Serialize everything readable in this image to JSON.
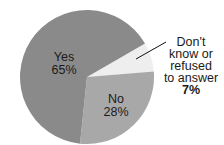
{
  "chart_data": {
    "type": "pie",
    "title": "",
    "slices": [
      {
        "label": "Yes",
        "value": 65,
        "display": "65%",
        "color": "#8a8a8a"
      },
      {
        "label": "No",
        "value": 28,
        "display": "28%",
        "color": "#a8a8a8"
      },
      {
        "label": "Don't know or refused to answer",
        "value": 7,
        "display": "7%",
        "color": "#eeeeee"
      }
    ],
    "start_angle_deg": 60,
    "direction": "clockwise",
    "legend": "none (labels on/near slices)"
  },
  "labels": {
    "yes": {
      "name": "Yes",
      "pct": "65%"
    },
    "no": {
      "name": "No",
      "pct": "28%"
    },
    "dk": {
      "lines": [
        "Don't",
        "know or",
        "refused",
        "to answer"
      ],
      "pct": "7%"
    }
  }
}
